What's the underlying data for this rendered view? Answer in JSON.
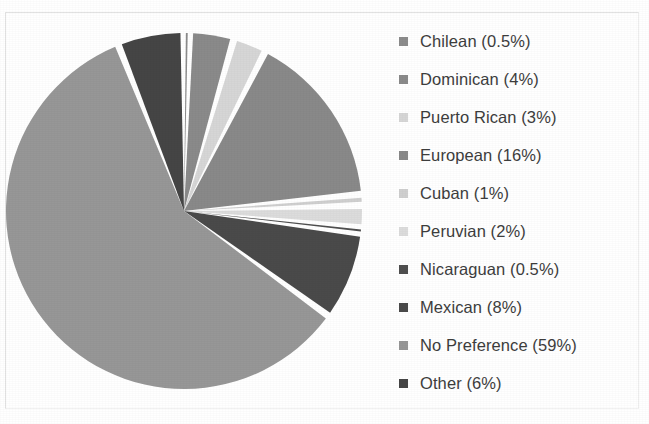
{
  "chart_data": {
    "type": "pie",
    "title": "",
    "subtitle": "",
    "xlabel": "",
    "ylabel": "",
    "legend_position": "right",
    "grid": false,
    "value_unit": "%",
    "start_angle_deg": 0,
    "direction": "clockwise",
    "categories": [
      "Chilean",
      "Dominican",
      "Puerto Rican",
      "European",
      "Cuban",
      "Peruvian",
      "Nicaraguan",
      "Mexican",
      "No Preference",
      "Other"
    ],
    "values": [
      0.5,
      4,
      3,
      16,
      1,
      2,
      0.5,
      8,
      59,
      6
    ],
    "labels": [
      "Chilean (0.5%)",
      "Dominican (4%)",
      "Puerto Rican (3%)",
      "European (16%)",
      "Cuban (1%)",
      "Peruvian (2%)",
      "Nicaraguan (0.5%)",
      "Mexican (8%)",
      "No Preference (59%)",
      "Other (6%)"
    ],
    "colors": [
      "#8c8c8c",
      "#8a8a8a",
      "#d6d6d6",
      "#898989",
      "#cfcfcf",
      "#dcdcdc",
      "#4f4f4f",
      "#4a4a4a",
      "#979797",
      "#454545"
    ],
    "slice_separator_color": "#ffffff"
  },
  "legend": {
    "items": [
      {
        "label": "Chilean (0.5%)",
        "color": "#8c8c8c",
        "value": 0.5
      },
      {
        "label": "Dominican (4%)",
        "color": "#8a8a8a",
        "value": 4
      },
      {
        "label": "Puerto Rican (3%)",
        "color": "#d6d6d6",
        "value": 3
      },
      {
        "label": "European (16%)",
        "color": "#898989",
        "value": 16
      },
      {
        "label": "Cuban (1%)",
        "color": "#cfcfcf",
        "value": 1
      },
      {
        "label": "Peruvian (2%)",
        "color": "#dcdcdc",
        "value": 2
      },
      {
        "label": "Nicaraguan (0.5%)",
        "color": "#4f4f4f",
        "value": 0.5
      },
      {
        "label": "Mexican (8%)",
        "color": "#4a4a4a",
        "value": 8
      },
      {
        "label": "No Preference (59%)",
        "color": "#979797",
        "value": 59
      },
      {
        "label": "Other (6%)",
        "color": "#454545",
        "value": 6
      }
    ]
  },
  "geometry": {
    "center_x": 184,
    "center_y": 211,
    "radius": 178
  }
}
